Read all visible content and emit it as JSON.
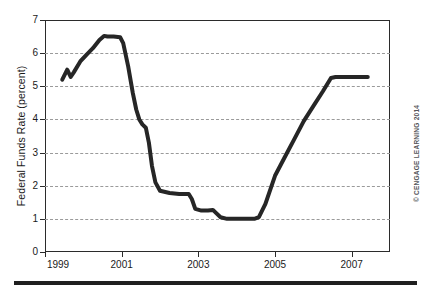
{
  "chart_data": {
    "type": "line",
    "title": "",
    "subtitle": "",
    "xlabel": "",
    "ylabel": "Federal Funds Rate (percent)",
    "xlim": [
      1999,
      2008
    ],
    "ylim": [
      0,
      7
    ],
    "grid": true,
    "grid_axis": "y",
    "grid_style": "dashed",
    "legend": false,
    "legend_position": "none",
    "y_ticks": [
      0,
      1,
      2,
      3,
      4,
      5,
      6,
      7
    ],
    "y_tick_labels": [
      "0",
      "1",
      "2",
      "3",
      "4",
      "5",
      "6",
      "7"
    ],
    "x_ticks": [
      1999,
      2001,
      2003,
      2005,
      2007
    ],
    "x_tick_labels": [
      "1999",
      "2001",
      "2003",
      "2005",
      "2007"
    ],
    "series": [
      {
        "name": "Federal Funds Rate",
        "color": "#262626",
        "line_width": 4,
        "x": [
          1999.45,
          1999.58,
          1999.67,
          1999.75,
          1999.92,
          2000.08,
          2000.25,
          2000.42,
          2000.54,
          2000.63,
          2000.79,
          2000.96,
          2001.04,
          2001.17,
          2001.29,
          2001.38,
          2001.46,
          2001.54,
          2001.63,
          2001.71,
          2001.79,
          2001.88,
          2002.0,
          2002.25,
          2002.5,
          2002.75,
          2002.83,
          2002.92,
          2003.08,
          2003.25,
          2003.38,
          2003.46,
          2003.58,
          2003.75,
          2004.0,
          2004.25,
          2004.46,
          2004.58,
          2004.75,
          2005.0,
          2005.25,
          2005.5,
          2005.75,
          2006.0,
          2006.25,
          2006.46,
          2006.58,
          2006.75,
          2007.0,
          2007.25,
          2007.42
        ],
        "y": [
          5.2,
          5.5,
          5.28,
          5.42,
          5.75,
          5.95,
          6.15,
          6.4,
          6.52,
          6.5,
          6.5,
          6.48,
          6.3,
          5.6,
          4.8,
          4.3,
          4.0,
          3.85,
          3.75,
          3.3,
          2.6,
          2.1,
          1.85,
          1.78,
          1.75,
          1.75,
          1.6,
          1.3,
          1.25,
          1.25,
          1.27,
          1.18,
          1.05,
          1.0,
          1.0,
          1.0,
          1.0,
          1.05,
          1.45,
          2.3,
          2.85,
          3.4,
          3.95,
          4.4,
          4.85,
          5.25,
          5.28,
          5.28,
          5.28,
          5.28,
          5.28
        ]
      }
    ],
    "annotations": {
      "credit": "© CENGAGE LEARNING 2014"
    }
  },
  "axes": {
    "y_title": "Federal Funds Rate (percent)",
    "y_ticks": [
      {
        "value": 7,
        "label": "7"
      },
      {
        "value": 6,
        "label": "6"
      },
      {
        "value": 5,
        "label": "5"
      },
      {
        "value": 4,
        "label": "4"
      },
      {
        "value": 3,
        "label": "3"
      },
      {
        "value": 2,
        "label": "2"
      },
      {
        "value": 1,
        "label": "1"
      },
      {
        "value": 0,
        "label": "0"
      }
    ],
    "x_ticks": [
      {
        "value": 1999,
        "label": "1999"
      },
      {
        "value": 2001,
        "label": "2001"
      },
      {
        "value": 2003,
        "label": "2003"
      },
      {
        "value": 2005,
        "label": "2005"
      },
      {
        "value": 2007,
        "label": "2007"
      }
    ]
  },
  "credit": {
    "text": "© CENGAGE LEARNING 2014"
  },
  "colors": {
    "line": "#262626",
    "grid": "#9a9a9a",
    "frame": "#2b2b2b",
    "text": "#1a1a1a",
    "credit": "#55565a",
    "rule": "#1f1f1f"
  }
}
